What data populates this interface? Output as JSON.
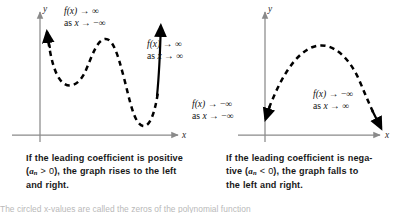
{
  "figure": {
    "type": "math-textbook-figure",
    "background_color": "#ffffff",
    "axis_color": "#808080",
    "curve_color": "#000000"
  },
  "panels": [
    {
      "id": "positive-leading-coefficient",
      "graph": {
        "axis_x_label": "x",
        "axis_y_label": "y",
        "curve_style": "dashed-with-solid-arrow-ends",
        "shape": "quartic-w-shape",
        "left_end_direction": "up",
        "right_end_direction": "up"
      },
      "annotations": [
        {
          "id": "left-end-behavior",
          "line1_fx": "f(x)",
          "line1_arrow": "→",
          "line1_limit": "∞",
          "line2_as": "as",
          "line2_x": "x",
          "line2_arrow": "→",
          "line2_limit": "−∞"
        },
        {
          "id": "right-end-behavior",
          "line1_fx": "f(x)",
          "line1_arrow": "→",
          "line1_limit": "∞",
          "line2_as": "as",
          "line2_x": "x",
          "line2_arrow": "→",
          "line2_limit": "∞"
        }
      ],
      "caption": {
        "part1": "If the leading coefficient is positive",
        "coef_open": "(",
        "coef_symbol": "a",
        "coef_subscript": "n",
        "coef_relation": " > 0",
        "coef_close": ")",
        "part2": ", the graph rises to the left",
        "part3": "and right."
      }
    },
    {
      "id": "negative-leading-coefficient",
      "graph": {
        "axis_x_label": "x",
        "axis_y_label": "y",
        "curve_style": "dashed-with-solid-arrow-ends",
        "shape": "downward-parabola-arch",
        "left_end_direction": "down",
        "right_end_direction": "down"
      },
      "annotations": [
        {
          "id": "left-end-behavior",
          "line1_fx": "f(x)",
          "line1_arrow": "→",
          "line1_limit": "−∞",
          "line2_as": "as",
          "line2_x": "x",
          "line2_arrow": "→",
          "line2_limit": "−∞"
        },
        {
          "id": "right-end-behavior",
          "line1_fx": "f(x)",
          "line1_arrow": "→",
          "line1_limit": "−∞",
          "line2_as": "as",
          "line2_x": "x",
          "line2_arrow": "→",
          "line2_limit": "∞"
        }
      ],
      "caption": {
        "part1": "If the leading coefficient is nega-",
        "part1b": "tive ",
        "coef_open": "(",
        "coef_symbol": "a",
        "coef_subscript": "n",
        "coef_relation": " < 0",
        "coef_close": ")",
        "part2": ", the graph falls to",
        "part3": "the left and right."
      }
    }
  ],
  "footer": {
    "partial_text": "The circled x-values are called the zeros of the polynomial function"
  }
}
